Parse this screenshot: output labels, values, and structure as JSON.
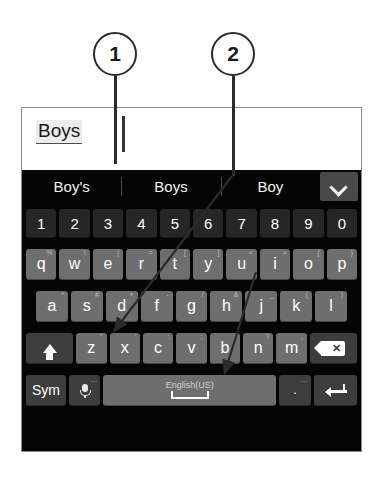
{
  "callouts": [
    {
      "number": "1",
      "target": "s-key"
    },
    {
      "number": "2",
      "target": "b-key"
    }
  ],
  "text_field": {
    "composing_text": "Boys",
    "caret": "text-cursor"
  },
  "suggestion_bar": {
    "suggestions": [
      "Boy's",
      "Boys",
      "Boy"
    ],
    "expand_icon": "chevron-down-icon"
  },
  "keyboard": {
    "language_label": "English(US)",
    "rows": {
      "numbers": [
        {
          "label": "1",
          "alt": ""
        },
        {
          "label": "2",
          "alt": ""
        },
        {
          "label": "3",
          "alt": ""
        },
        {
          "label": "4",
          "alt": ""
        },
        {
          "label": "5",
          "alt": ""
        },
        {
          "label": "6",
          "alt": ""
        },
        {
          "label": "7",
          "alt": ""
        },
        {
          "label": "8",
          "alt": ""
        },
        {
          "label": "9",
          "alt": ""
        },
        {
          "label": "0",
          "alt": ""
        }
      ],
      "top": [
        {
          "label": "q",
          "alt": "%"
        },
        {
          "label": "w",
          "alt": "\\"
        },
        {
          "label": "e",
          "alt": "|"
        },
        {
          "label": "r",
          "alt": "="
        },
        {
          "label": "t",
          "alt": "["
        },
        {
          "label": "y",
          "alt": "]"
        },
        {
          "label": "u",
          "alt": "<"
        },
        {
          "label": "i",
          "alt": ">"
        },
        {
          "label": "o",
          "alt": "{"
        },
        {
          "label": "p",
          "alt": "}"
        }
      ],
      "home": [
        {
          "label": "a",
          "alt": "*"
        },
        {
          "label": "s",
          "alt": "#"
        },
        {
          "label": "d",
          "alt": "+"
        },
        {
          "label": "f",
          "alt": "-"
        },
        {
          "label": "g",
          "alt": "/"
        },
        {
          "label": "h",
          "alt": "&"
        },
        {
          "label": "j",
          "alt": "_"
        },
        {
          "label": "k",
          "alt": "("
        },
        {
          "label": "l",
          "alt": ")"
        }
      ],
      "bottom": [
        {
          "label": "z",
          "alt": "\""
        },
        {
          "label": "x",
          "alt": "'"
        },
        {
          "label": "c",
          "alt": ":"
        },
        {
          "label": "v",
          "alt": ";"
        },
        {
          "label": "b",
          "alt": "!"
        },
        {
          "label": "n",
          "alt": "?"
        },
        {
          "label": "m",
          "alt": ","
        }
      ]
    },
    "shift_key": {
      "icon": "shift-arrow-icon"
    },
    "backspace_key": {
      "icon": "backspace-icon"
    },
    "sym_key": {
      "label": "Sym"
    },
    "mic_key": {
      "icon": "microphone-icon",
      "alt": "..."
    },
    "period_key": {
      "label": ".",
      "alt": "..."
    },
    "enter_key": {
      "icon": "enter-arrow-icon"
    }
  }
}
